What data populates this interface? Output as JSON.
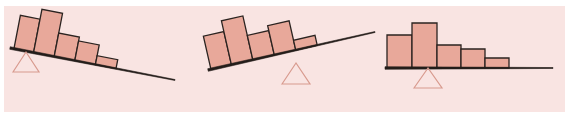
{
  "figure": {
    "width": 579,
    "height": 118,
    "page_background": "#ffffff",
    "panel_background": "#f9e4e2",
    "panel": {
      "x": 4,
      "y": 6,
      "width": 561,
      "height": 106
    },
    "colors": {
      "bar_fill": "#e8a89a",
      "bar_stroke": "#2b2320",
      "lever_stroke": "#241d1a",
      "fulcrum_stroke": "#d89a8e",
      "fulcrum_fill": "none",
      "panel_background": "#f9e4e2",
      "page_background": "#ffffff"
    },
    "stroke_widths": {
      "bar": 1.3,
      "lever": 2.6,
      "fulcrum": 1.2
    }
  },
  "chart_data": {
    "type": "bar",
    "subtitle": "Three right-skewed histograms resting on a lever, each balanced on a triangular fulcrum at a different position",
    "xlabel": "",
    "ylabel": "",
    "grid": false,
    "legend": null,
    "panels": [
      {
        "name": "left-panel",
        "label": "Panel 1 — fulcrum far left, lever tips down to the right",
        "lever": {
          "x1": 10,
          "y1": 48,
          "x2": 175,
          "y2": 80,
          "angle_deg": 11.0,
          "tilt": "down-right"
        },
        "fulcrum": {
          "cx": 26,
          "cy": 72,
          "half_width": 13,
          "height": 20,
          "apex_y": 52
        },
        "bars": [
          {
            "index": 0,
            "value": 7,
            "width": 20,
            "height": 34
          },
          {
            "index": 1,
            "value": 9,
            "width": 21,
            "height": 44
          },
          {
            "index": 2,
            "value": 5,
            "width": 21,
            "height": 24
          },
          {
            "index": 3,
            "value": 4,
            "width": 21,
            "height": 20
          },
          {
            "index": 4,
            "value": 2,
            "width": 21,
            "height": 9
          }
        ],
        "bar_start_offset": 4,
        "categories": [
          "1",
          "2",
          "3",
          "4",
          "5"
        ],
        "values": [
          7,
          9,
          5,
          4,
          2
        ]
      },
      {
        "name": "middle-panel",
        "label": "Panel 2 — fulcrum at center-left, lever tips up to the right",
        "lever": {
          "x1": 208,
          "y1": 70,
          "x2": 375,
          "y2": 32,
          "angle_deg": -12.8,
          "tilt": "up-right"
        },
        "fulcrum": {
          "cx": 296,
          "cy": 84,
          "half_width": 14,
          "height": 21,
          "apex_y": 63
        },
        "bars": [
          {
            "index": 0,
            "value": 7,
            "width": 21,
            "height": 34
          },
          {
            "index": 1,
            "value": 9,
            "width": 22,
            "height": 45
          },
          {
            "index": 2,
            "value": 5,
            "width": 22,
            "height": 25
          },
          {
            "index": 3,
            "value": 6,
            "width": 22,
            "height": 30
          },
          {
            "index": 4,
            "value": 2,
            "width": 22,
            "height": 10
          }
        ],
        "bar_start_offset": 3,
        "categories": [
          "1",
          "2",
          "3",
          "4",
          "5"
        ],
        "values": [
          7,
          9,
          5,
          6,
          2
        ]
      },
      {
        "name": "right-panel",
        "label": "Panel 3 — fulcrum under the second bar, lever level",
        "lever": {
          "x1": 385,
          "y1": 68,
          "x2": 553,
          "y2": 68,
          "angle_deg": 0.0,
          "tilt": "level"
        },
        "fulcrum": {
          "cx": 428,
          "cy": 88,
          "half_width": 14,
          "height": 20,
          "apex_y": 68
        },
        "bars": [
          {
            "index": 0,
            "value": 7,
            "width": 25,
            "height": 33
          },
          {
            "index": 1,
            "value": 9,
            "width": 25,
            "height": 45
          },
          {
            "index": 2,
            "value": 5,
            "width": 24,
            "height": 23
          },
          {
            "index": 3,
            "value": 4,
            "width": 24,
            "height": 19
          },
          {
            "index": 4,
            "value": 2,
            "width": 24,
            "height": 10
          }
        ],
        "bar_start_offset": 2,
        "categories": [
          "1",
          "2",
          "3",
          "4",
          "5"
        ],
        "values": [
          7,
          9,
          5,
          4,
          2
        ]
      }
    ]
  }
}
